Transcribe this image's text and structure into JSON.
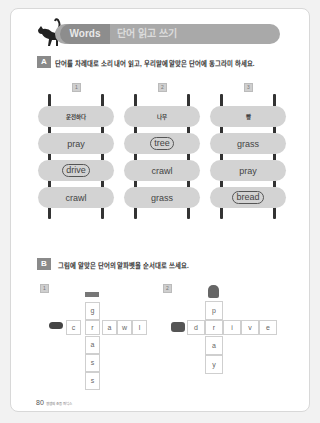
{
  "header": {
    "words_label": "Words",
    "title_kr": "단어 읽고 쓰기"
  },
  "section_a": {
    "badge": "A",
    "instruction": "단어를 차례대로 소리 내어 읽고, 우리말에 알맞은 단어에 동그라미 하세요.",
    "ladders": [
      {
        "number": "1",
        "korean": "운전하다",
        "options": [
          "pray",
          "drive",
          "crawl"
        ],
        "circled": "drive"
      },
      {
        "number": "2",
        "korean": "나무",
        "options": [
          "tree",
          "crawl",
          "grass"
        ],
        "circled": "tree"
      },
      {
        "number": "3",
        "korean": "빵",
        "options": [
          "grass",
          "pray",
          "bread"
        ],
        "circled": "bread"
      }
    ]
  },
  "section_b": {
    "badge": "B",
    "instruction": "그림에 알맞은 단어의 알파벳을 순서대로 쓰세요.",
    "puzzles": [
      {
        "number": "1",
        "across": [
          "c",
          "r",
          "a",
          "w",
          "l"
        ],
        "down": [
          "g",
          "r",
          "a",
          "s",
          "s"
        ],
        "across_word": "crawl",
        "down_word": "grass"
      },
      {
        "number": "2",
        "across": [
          "d",
          "r",
          "i",
          "v",
          "e"
        ],
        "down": [
          "p",
          "r",
          "a",
          "y"
        ],
        "across_word": "drive",
        "down_word": "pray"
      }
    ]
  },
  "footer": {
    "page_number": "80",
    "book_title": "영쌤의 초등 파닉스"
  }
}
